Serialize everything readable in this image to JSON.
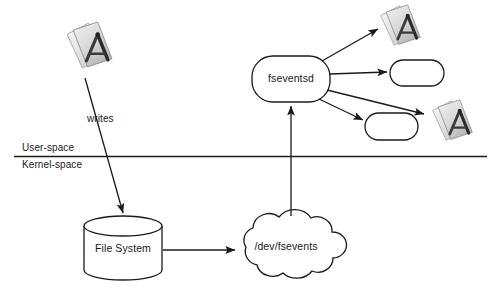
{
  "diagram": {
    "background": "#ffffff",
    "stroke_color": "#1a1a1a",
    "nodes": {
      "writer_app": {
        "icon": "textedit-app-icon",
        "label": ""
      },
      "fseventsd": {
        "label": "fseventsd",
        "shape": "rounded-rectangle"
      },
      "file_system": {
        "label": "File System",
        "shape": "cylinder"
      },
      "dev_fsevents": {
        "label": "/dev/fsevents",
        "shape": "cloud"
      },
      "client_app_1": {
        "icon": "textedit-app-icon",
        "label": ""
      },
      "client_box_1": {
        "label": "",
        "shape": "rounded-rectangle"
      },
      "client_box_2": {
        "label": "",
        "shape": "rounded-rectangle"
      },
      "client_app_2": {
        "icon": "textedit-app-icon",
        "label": ""
      }
    },
    "edges": {
      "writes": {
        "label": "writes",
        "from": "writer_app",
        "to": "file_system"
      },
      "fs_to_device": {
        "label": "",
        "from": "file_system",
        "to": "dev_fsevents"
      },
      "device_to_daemon": {
        "label": "",
        "from": "dev_fsevents",
        "to": "fseventsd"
      },
      "daemon_to_client_app_1": {
        "label": "",
        "from": "fseventsd",
        "to": "client_app_1"
      },
      "daemon_to_client_box_1": {
        "label": "",
        "from": "fseventsd",
        "to": "client_box_1"
      },
      "daemon_to_client_app_2": {
        "label": "",
        "from": "fseventsd",
        "to": "client_app_2"
      },
      "daemon_to_client_box_2": {
        "label": "",
        "from": "fseventsd",
        "to": "client_box_2"
      }
    },
    "boundary": {
      "upper_label": "User-space",
      "lower_label": "Kernel-space"
    }
  }
}
